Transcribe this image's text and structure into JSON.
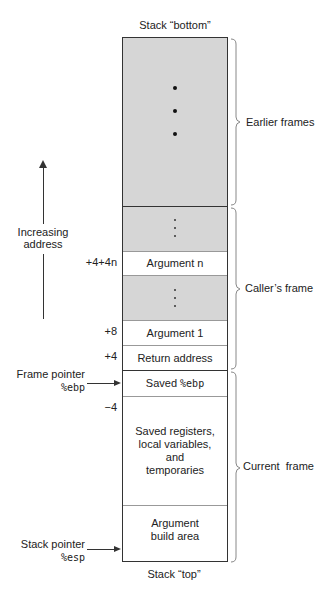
{
  "diagram": {
    "top_label": "Stack “bottom”",
    "bottom_label": "Stack “top”",
    "direction_arrow": {
      "label_line1": "Increasing",
      "label_line2": "address"
    },
    "cells": [
      {
        "id": "earlier",
        "label": "",
        "shaded": true,
        "content": "large-dots"
      },
      {
        "id": "caller-dots-upper",
        "label": "",
        "shaded": true,
        "content": "small-dots"
      },
      {
        "id": "argument-n",
        "label": "Argument n",
        "offset": "+4+4n"
      },
      {
        "id": "caller-dots-lower",
        "label": "",
        "shaded": true,
        "content": "small-dots"
      },
      {
        "id": "argument-1",
        "label": "Argument 1",
        "offset": "+8"
      },
      {
        "id": "return-address",
        "label": "Return address",
        "offset": "+4"
      },
      {
        "id": "saved-ebp",
        "label_prefix": "Saved ",
        "label_reg": "%ebp"
      },
      {
        "id": "saved-registers",
        "label_line1": "Saved registers,",
        "label_line2": "local variables,",
        "label_line3": "and",
        "label_line4": "temporaries",
        "offset": "−4"
      },
      {
        "id": "argument-build",
        "label_line1": "Argument",
        "label_line2": "build area"
      }
    ],
    "braces": [
      {
        "label": "Earlier frames"
      },
      {
        "label": "Caller’s frame"
      },
      {
        "label": "Current  frame"
      }
    ],
    "pointers": [
      {
        "name": "Frame pointer",
        "reg": "%ebp"
      },
      {
        "name": "Stack pointer",
        "reg": "%esp"
      }
    ],
    "colors": {
      "shade": "#d6d6d6",
      "line": "#333333"
    }
  }
}
